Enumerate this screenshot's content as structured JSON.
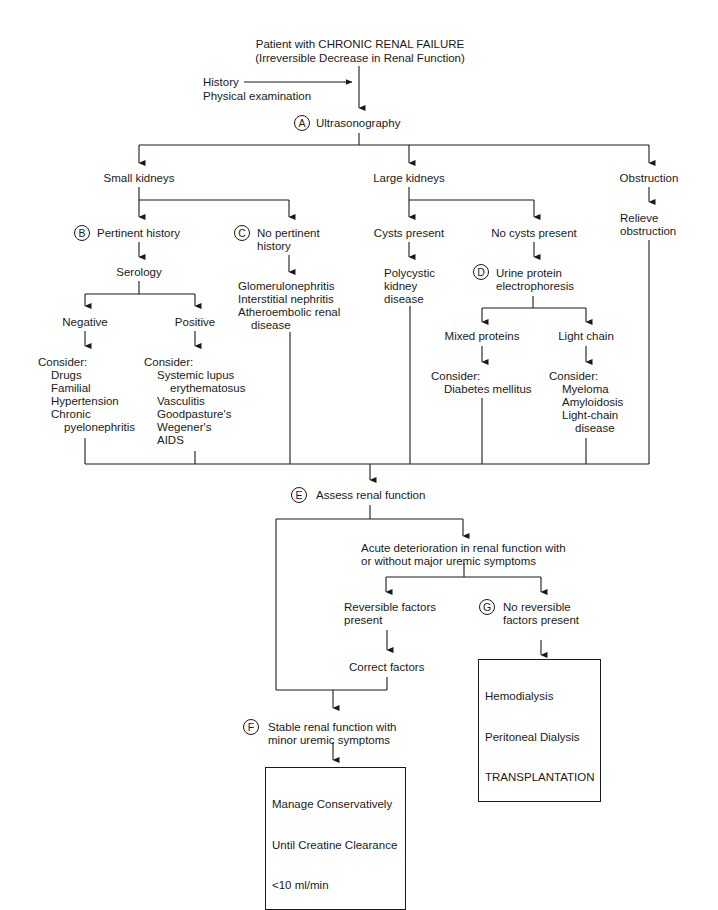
{
  "title": {
    "line1": "Patient with CHRONIC RENAL FAILURE",
    "line2": "(Irreversible Decrease in Renal Function)"
  },
  "inputs": {
    "line1": "History",
    "line2": "Physical examination"
  },
  "nodes": {
    "A": {
      "badge": "A",
      "label": "Ultrasonography"
    },
    "small_kidneys": {
      "label": "Small kidneys"
    },
    "large_kidneys": {
      "label": "Large kidneys"
    },
    "obstruction": {
      "label": "Obstruction"
    },
    "relieve": {
      "line1": "Relieve",
      "line2": "obstruction"
    },
    "B": {
      "badge": "B",
      "label": "Pertinent history"
    },
    "C": {
      "badge": "C",
      "line1": "No pertinent",
      "line2": "history"
    },
    "serology": {
      "label": "Serology"
    },
    "c_result": {
      "line1": "Glomerulonephritis",
      "line2": "Interstitial nephritis",
      "line3": "Atheroembolic renal",
      "line4": "disease"
    },
    "cysts_present": {
      "label": "Cysts present"
    },
    "no_cysts": {
      "label": "No cysts present"
    },
    "polycystic": {
      "line1": "Polycystic",
      "line2": "kidney",
      "line3": "disease"
    },
    "D": {
      "badge": "D",
      "line1": "Urine protein",
      "line2": "electrophoresis"
    },
    "negative": {
      "label": "Negative"
    },
    "positive": {
      "label": "Positive"
    },
    "negative_consider": {
      "heading": "Consider:",
      "items": [
        "Drugs",
        "Familial",
        "Hypertension",
        "Chronic",
        "pyelonephritis"
      ]
    },
    "positive_consider": {
      "heading": "Consider:",
      "items": [
        "Systemic lupus",
        "erythematosus",
        "Vasculitis",
        "Goodpasture's",
        "Wegener's",
        "AIDS"
      ]
    },
    "mixed_proteins": {
      "label": "Mixed proteins"
    },
    "light_chain": {
      "label": "Light chain"
    },
    "mixed_consider": {
      "heading": "Consider:",
      "items": [
        "Diabetes mellitus"
      ]
    },
    "light_consider": {
      "heading": "Consider:",
      "items": [
        "Myeloma",
        "Amyloidosis",
        "Light-chain",
        "disease"
      ]
    },
    "E": {
      "badge": "E",
      "label": "Assess renal function"
    },
    "acute": {
      "line1": "Acute deterioration in renal function with",
      "line2": "or without major uremic symptoms"
    },
    "reversible": {
      "line1": "Reversible factors",
      "line2": "present"
    },
    "G": {
      "badge": "G",
      "line1": "No reversible",
      "line2": "factors present"
    },
    "correct": {
      "label": "Correct factors"
    },
    "dialysis_box": {
      "line1": "Hemodialysis",
      "line2": "Peritoneal Dialysis",
      "line3": "TRANSPLANTATION"
    },
    "F": {
      "badge": "F",
      "line1": "Stable renal function with",
      "line2": "minor uremic symptoms"
    },
    "manage_box": {
      "line1": "Manage Conservatively",
      "line2": "Until Creatine Clearance",
      "line3": "<10 ml/min"
    }
  }
}
